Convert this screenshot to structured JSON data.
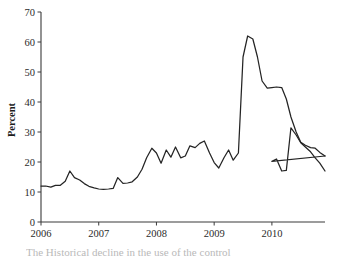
{
  "figure": {
    "background_color": "#ffffff",
    "line_color": "#242424",
    "axis_color": "#3a3a3a",
    "caption_partial": "The Historical decline in the use of the control"
  },
  "chart_data": {
    "type": "line",
    "title": "",
    "xlabel": "",
    "ylabel": "Percent",
    "ylim": [
      0,
      70
    ],
    "yticks": [
      0,
      10,
      20,
      30,
      40,
      50,
      60,
      70
    ],
    "ytick_labels": [
      "0",
      "10",
      "20",
      "30",
      "40",
      "50",
      "60",
      "70"
    ],
    "xlim": [
      2006.0,
      2010.92
    ],
    "xticks": [
      2006,
      2007,
      2008,
      2009,
      2010
    ],
    "xtick_labels": [
      "2006",
      "2007",
      "2008",
      "2009",
      "2010"
    ],
    "grid": false,
    "legend": false,
    "series": [
      {
        "name": "Percent",
        "x": [
          2006.0,
          2006.08,
          2006.17,
          2006.25,
          2006.33,
          2006.42,
          2006.5,
          2006.58,
          2006.67,
          2006.75,
          2006.83,
          2006.92,
          2007.0,
          2007.08,
          2007.17,
          2007.25,
          2007.33,
          2007.42,
          2007.5,
          2007.58,
          2007.67,
          2007.75,
          2007.83,
          2007.92,
          2008.0,
          2008.08,
          2008.17,
          2008.25,
          2008.33,
          2008.42,
          2008.5,
          2008.58,
          2008.67,
          2008.75,
          2008.83,
          2008.92,
          2009.0,
          2009.08,
          2009.17,
          2009.25,
          2009.33,
          2009.42,
          2009.5,
          2009.58,
          2009.67,
          2009.75,
          2009.83,
          2009.92,
          2010.0,
          2010.08,
          2010.17,
          2010.25,
          2010.33,
          2010.42,
          2010.5,
          2010.58,
          2010.67,
          2010.75,
          2010.83,
          2010.92
        ],
        "values": [
          12.0,
          12.0,
          11.6,
          12.2,
          12.2,
          13.6,
          17.0,
          14.8,
          14.0,
          12.8,
          11.9,
          11.4,
          11.0,
          10.9,
          11.0,
          11.2,
          14.8,
          12.9,
          13.0,
          13.4,
          15.0,
          17.6,
          21.4,
          24.6,
          23.0,
          19.6,
          24.0,
          21.6,
          25.0,
          21.4,
          22.0,
          25.4,
          24.8,
          26.2,
          27.0,
          23.0,
          19.8,
          18.0,
          21.4,
          24.0,
          20.6,
          23.0,
          55.0,
          62.0,
          61.0,
          55.0,
          47.0,
          44.6,
          44.8,
          45.0,
          44.8,
          41.0,
          35.0,
          30.0,
          26.6,
          25.6,
          24.8,
          24.6,
          23.2,
          22.0
        ]
      }
    ],
    "series_tail": {
      "name": "Percent (continued)",
      "x": [
        2009.92,
        2010.0,
        2010.08,
        2010.17,
        2010.25,
        2010.33,
        2010.42,
        2010.5,
        2010.58,
        2010.67,
        2010.75,
        2010.83,
        2010.92
      ],
      "values": [
        20.4,
        20.2,
        21.0,
        17.0,
        17.2,
        31.4,
        29.0,
        26.4,
        25.0,
        23.4,
        21.4,
        19.6,
        17.0
      ]
    },
    "annotations": [
      {
        "label": "early plateau",
        "approx_value": 11.0,
        "approx_x": 2007.0
      },
      {
        "label": "peak",
        "approx_value": 62.0,
        "approx_x": 2008.75
      },
      {
        "label": "post-peak plateau",
        "approx_value": 45.0,
        "approx_x": 2009.1
      },
      {
        "label": "late spike",
        "approx_value": 31.4,
        "approx_x": 2010.3
      },
      {
        "label": "final value",
        "approx_value": 17.0,
        "approx_x": 2010.92
      }
    ]
  }
}
